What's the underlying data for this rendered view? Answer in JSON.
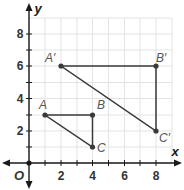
{
  "diagram": {
    "type": "coordinate-plane",
    "axes": {
      "x_label": "x",
      "y_label": "y",
      "origin_label": "O",
      "x_ticks": [
        "2",
        "4",
        "6",
        "8"
      ],
      "y_ticks": [
        "2",
        "4",
        "6",
        "8"
      ],
      "x_range": [
        0,
        9
      ],
      "y_range": [
        0,
        9
      ],
      "grid": true
    },
    "triangles": [
      {
        "name": "ABC",
        "points": [
          {
            "label": "A",
            "x": 1,
            "y": 3
          },
          {
            "label": "B",
            "x": 4,
            "y": 3
          },
          {
            "label": "C",
            "x": 4,
            "y": 1
          }
        ]
      },
      {
        "name": "A'B'C'",
        "points": [
          {
            "label": "A′",
            "x": 2,
            "y": 6
          },
          {
            "label": "B′",
            "x": 8,
            "y": 6
          },
          {
            "label": "C′",
            "x": 8,
            "y": 2
          }
        ]
      }
    ],
    "colors": {
      "grid": "#e3e3e3",
      "axis": "#1a1a1a",
      "shape": "#3a3a3a",
      "label": "#555555"
    }
  }
}
